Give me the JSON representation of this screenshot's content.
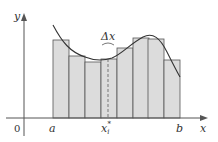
{
  "diagram": {
    "type": "riemann-sum",
    "labels": {
      "y_axis": "y",
      "x_axis": "x",
      "origin": "0",
      "a": "a",
      "b": "b",
      "xi_star": "x",
      "xi_sub": "i",
      "xi_sup": "*",
      "delta_x": "Δx"
    },
    "colors": {
      "bar_fill": "#dcdcdc",
      "bar_stroke": "#555555",
      "axis": "#555555",
      "curve": "#333333",
      "dashed": "#888888"
    },
    "bars": [
      {
        "x": 53,
        "top": 40
      },
      {
        "x": 69,
        "top": 56
      },
      {
        "x": 85,
        "top": 62
      },
      {
        "x": 101,
        "top": 59
      },
      {
        "x": 117,
        "top": 48
      },
      {
        "x": 133,
        "top": 38
      },
      {
        "x": 148,
        "top": 39
      },
      {
        "x": 164,
        "top": 60
      }
    ],
    "bar_width": 16,
    "baseline": 118
  }
}
